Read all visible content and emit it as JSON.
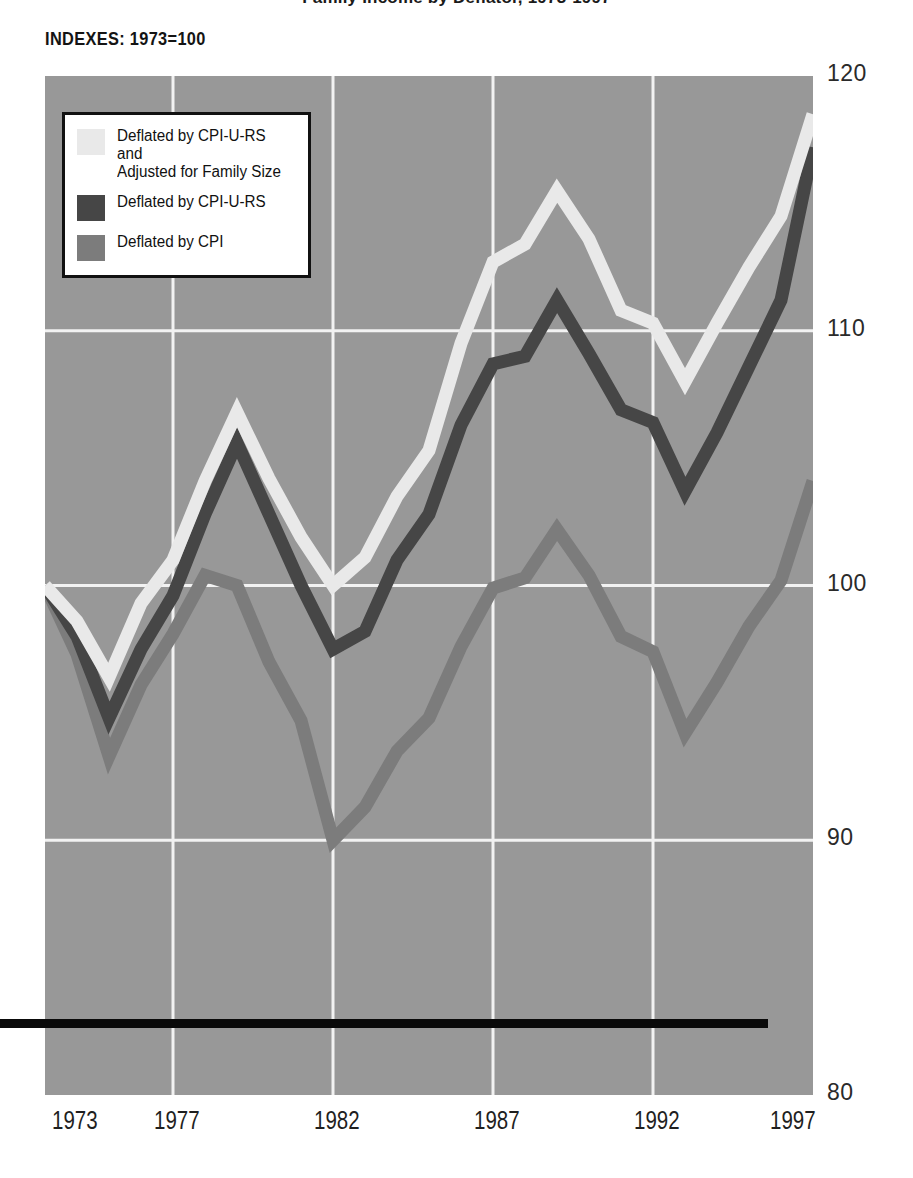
{
  "title": "Family Income by Deflator, 1973-1997",
  "subtitle": "INDEXES: 1973=100",
  "colors": {
    "plot_background": "#989898",
    "gridline": "#f2f2f2",
    "baseline": "#0a0a0a",
    "series_light": "#e9e9e9",
    "series_dark": "#464646",
    "series_gray": "#7c7c7c",
    "legend_background": "#ffffff",
    "legend_border": "#111111",
    "text": "#1a1a1a"
  },
  "legend": {
    "position": "top-left-inside",
    "items": [
      {
        "label": "Deflated by CPI-U-RS and\nAdjusted for Family Size",
        "color": "#e9e9e9",
        "swatch_name": "legend-swatch-cpi-u-rs-adjusted"
      },
      {
        "label": "Deflated by CPI-U-RS",
        "color": "#464646",
        "swatch_name": "legend-swatch-cpi-u-rs"
      },
      {
        "label": "Deflated by CPI",
        "color": "#7c7c7c",
        "swatch_name": "legend-swatch-cpi"
      }
    ]
  },
  "axes": {
    "y_ticks": [
      "120",
      "110",
      "100",
      "90",
      "80"
    ],
    "y_tick_values": [
      120,
      110,
      100,
      90,
      80
    ],
    "x_ticks": [
      "1973",
      "1977",
      "1982",
      "1987",
      "1992",
      "1997"
    ],
    "x_tick_values": [
      1973,
      1977,
      1982,
      1987,
      1992,
      1997
    ],
    "gridlines": "white horizontal at 110,100,90 and vertical at 1977,1982,1987,1992"
  },
  "chart_data": {
    "type": "line",
    "title": "Family Income by Deflator, 1973-1997",
    "subtitle": "INDEXES: 1973=100",
    "xlabel": "",
    "ylabel": "INDEXES: 1973=100",
    "xlim": [
      1973,
      1997
    ],
    "ylim": [
      80,
      120
    ],
    "grid": true,
    "legend_position": "upper left",
    "x": [
      1973,
      1974,
      1975,
      1976,
      1977,
      1978,
      1979,
      1980,
      1981,
      1982,
      1983,
      1984,
      1985,
      1986,
      1987,
      1988,
      1989,
      1990,
      1991,
      1992,
      1993,
      1994,
      1995,
      1996,
      1997
    ],
    "series": [
      {
        "name": "Deflated by CPI-U-RS and Adjusted for Family Size",
        "color": "#e9e9e9",
        "values": [
          100.0,
          98.6,
          96.4,
          99.3,
          101.0,
          104.1,
          106.8,
          104.2,
          101.9,
          100.0,
          101.1,
          103.5,
          105.3,
          109.5,
          112.7,
          113.4,
          115.5,
          113.6,
          110.8,
          110.3,
          108.0,
          110.3,
          112.5,
          114.5,
          118.5
        ]
      },
      {
        "name": "Deflated by CPI-U-RS",
        "color": "#464646",
        "values": [
          100.0,
          98.0,
          94.8,
          97.5,
          99.6,
          102.8,
          105.6,
          102.8,
          100.0,
          97.5,
          98.2,
          101.0,
          102.8,
          106.3,
          108.7,
          109.0,
          111.2,
          109.1,
          106.9,
          106.4,
          103.7,
          106.0,
          108.6,
          111.2,
          117.2
        ]
      },
      {
        "name": "Deflated by CPI",
        "color": "#7c7c7c",
        "values": [
          100.0,
          97.3,
          93.3,
          96.1,
          98.1,
          100.4,
          100.0,
          97.0,
          94.7,
          90.0,
          91.3,
          93.5,
          94.8,
          97.6,
          99.9,
          100.3,
          102.2,
          100.4,
          98.0,
          97.4,
          94.2,
          96.2,
          98.4,
          100.2,
          104.1
        ]
      }
    ]
  }
}
